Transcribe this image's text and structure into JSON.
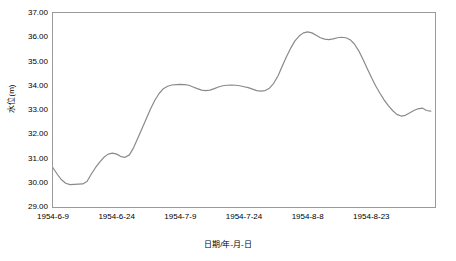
{
  "chart_data": {
    "type": "line",
    "title": "",
    "xlabel": "日期/年-月-日",
    "ylabel": "水位(m)",
    "ylim": [
      29.0,
      37.0
    ],
    "ytick_labels": [
      "37.00",
      "36.00",
      "35.00",
      "34.00",
      "33.00",
      "32.00",
      "31.00",
      "30.00",
      "29.00"
    ],
    "ytick_values": [
      37.0,
      36.0,
      35.0,
      34.0,
      33.0,
      32.0,
      31.0,
      30.0,
      29.0
    ],
    "xtick_labels": [
      "1954-6-9",
      "1954-6-24",
      "1954-7-9",
      "1954-7-24",
      "1954-8-8",
      "1954-8-23"
    ],
    "xtick_positions": [
      0,
      15,
      30,
      45,
      60,
      75
    ],
    "xlim": [
      0,
      90
    ],
    "grid": false,
    "legend": "none",
    "line_color": "#8a8a8a",
    "frame_color": "#9a9a9a",
    "series": [
      {
        "name": "水位",
        "x": [
          0,
          1,
          2,
          3,
          4,
          5,
          6,
          7,
          8,
          9,
          10,
          11,
          12,
          13,
          14,
          15,
          16,
          17,
          18,
          19,
          20,
          21,
          22,
          23,
          24,
          25,
          26,
          27,
          28,
          29,
          30,
          31,
          32,
          33,
          34,
          35,
          36,
          37,
          38,
          39,
          40,
          41,
          42,
          43,
          44,
          45,
          46,
          47,
          48,
          49,
          50,
          51,
          52,
          53,
          54,
          55,
          56,
          57,
          58,
          59,
          60,
          61,
          62,
          63,
          64,
          65,
          66,
          67,
          68,
          69,
          70,
          71,
          72,
          73,
          74,
          75,
          76,
          77,
          78,
          79,
          80,
          81,
          82,
          83,
          84,
          85,
          86,
          87,
          88,
          89
        ],
        "values": [
          30.62,
          30.35,
          30.12,
          29.98,
          29.92,
          29.93,
          29.94,
          29.95,
          30.05,
          30.35,
          30.62,
          30.85,
          31.05,
          31.18,
          31.22,
          31.18,
          31.08,
          31.05,
          31.15,
          31.45,
          31.85,
          32.25,
          32.65,
          33.05,
          33.4,
          33.68,
          33.88,
          33.98,
          34.03,
          34.05,
          34.06,
          34.05,
          34.02,
          33.95,
          33.88,
          33.82,
          33.8,
          33.82,
          33.88,
          33.95,
          34.0,
          34.02,
          34.03,
          34.02,
          34.0,
          33.96,
          33.92,
          33.86,
          33.8,
          33.78,
          33.8,
          33.9,
          34.1,
          34.4,
          34.8,
          35.2,
          35.55,
          35.85,
          36.05,
          36.18,
          36.22,
          36.18,
          36.08,
          35.98,
          35.92,
          35.9,
          35.93,
          35.98,
          36.0,
          35.98,
          35.9,
          35.72,
          35.45,
          35.1,
          34.72,
          34.35,
          34.0,
          33.7,
          33.42,
          33.18,
          32.98,
          32.82,
          32.75,
          32.78,
          32.88,
          32.98,
          33.05,
          33.08,
          32.98,
          32.95
        ]
      }
    ]
  }
}
